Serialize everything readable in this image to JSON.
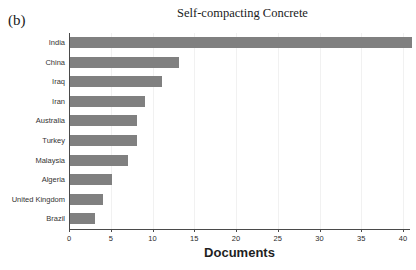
{
  "panel": {
    "label": "(b)"
  },
  "chart_data": {
    "type": "bar",
    "orientation": "horizontal",
    "title": "Self-compacting Concrete",
    "xlabel": "Documents",
    "ylabel": "",
    "categories": [
      "India",
      "China",
      "Iraq",
      "Iran",
      "Australia",
      "Turkey",
      "Malaysia",
      "Algeria",
      "United Kingdom",
      "Brazil"
    ],
    "values": [
      41,
      13,
      11,
      9,
      8,
      8,
      7,
      5,
      4,
      3
    ],
    "xlim": [
      0,
      41
    ],
    "xticks": [
      0,
      5,
      10,
      15,
      20,
      25,
      30,
      35,
      40
    ],
    "xticklabels": [
      "0",
      "5",
      "10",
      "15",
      "20",
      "25",
      "30",
      "35",
      "40"
    ],
    "grid": "vertical-light",
    "legend": null,
    "bar_color": "#808080",
    "axis_color": "#4a4a4a",
    "grid_color": "#f1f1f1",
    "background": "#ffffff"
  }
}
